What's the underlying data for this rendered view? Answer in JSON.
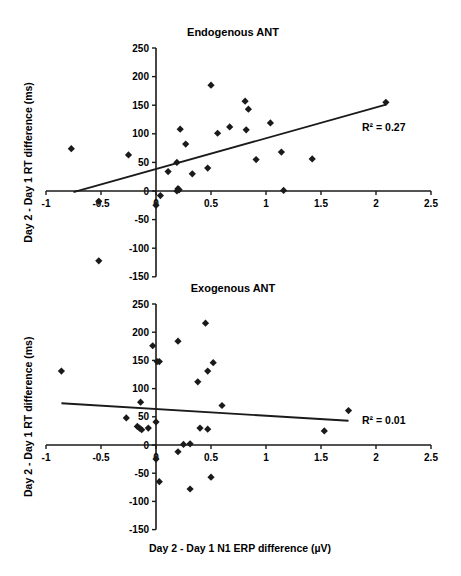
{
  "chart_data": [
    {
      "type": "scatter",
      "title": "Endogenous ANT",
      "xlabel": "",
      "ylabel": "Day 2 - Day 1 RT difference (ms)",
      "xlim": [
        -1,
        2.5
      ],
      "ylim": [
        -150,
        250
      ],
      "xticks": [
        "-1",
        "-0.5",
        "0",
        "0.5",
        "1",
        "1.5",
        "2",
        "2.5"
      ],
      "yticks": [
        "250",
        "200",
        "150",
        "100",
        "50",
        "0",
        "-50",
        "-100",
        "-150"
      ],
      "grid": false,
      "legend": null,
      "annotation": "R² = 0.27",
      "points": [
        [
          -0.77,
          74
        ],
        [
          -0.52,
          -18
        ],
        [
          -0.52,
          -122
        ],
        [
          -0.25,
          63
        ],
        [
          0.0,
          -25
        ],
        [
          0.04,
          -8
        ],
        [
          0.11,
          34
        ],
        [
          0.19,
          50
        ],
        [
          0.19,
          0
        ],
        [
          0.2,
          4
        ],
        [
          0.21,
          2
        ],
        [
          0.22,
          108
        ],
        [
          0.27,
          82
        ],
        [
          0.33,
          30
        ],
        [
          0.47,
          40
        ],
        [
          0.5,
          185
        ],
        [
          0.56,
          101
        ],
        [
          0.67,
          112
        ],
        [
          0.81,
          157
        ],
        [
          0.82,
          107
        ],
        [
          0.84,
          143
        ],
        [
          0.91,
          55
        ],
        [
          1.04,
          119
        ],
        [
          1.14,
          68
        ],
        [
          1.16,
          1
        ],
        [
          1.42,
          56
        ],
        [
          2.09,
          155
        ]
      ],
      "trendline": {
        "x": [
          -0.75,
          2.09
        ],
        "y": [
          -2,
          151
        ]
      }
    },
    {
      "type": "scatter",
      "title": "Exogenous ANT",
      "xlabel": "Day 2 - Day 1 N1 ERP difference (µV)",
      "ylabel": "Day 2 - Day 1 RT difference (ms)",
      "xlim": [
        -1,
        2.5
      ],
      "ylim": [
        -150,
        250
      ],
      "xticks": [
        "-1",
        "-0.5",
        "0",
        "0.5",
        "1",
        "1.5",
        "2",
        "2.5"
      ],
      "yticks": [
        "250",
        "200",
        "150",
        "100",
        "50",
        "0",
        "-50",
        "-100",
        "-150"
      ],
      "grid": false,
      "legend": null,
      "annotation": "R² = 0.01",
      "points": [
        [
          -0.86,
          131
        ],
        [
          -0.27,
          48
        ],
        [
          -0.17,
          33
        ],
        [
          -0.15,
          30
        ],
        [
          -0.14,
          76
        ],
        [
          -0.13,
          27
        ],
        [
          -0.07,
          30
        ],
        [
          -0.03,
          176
        ],
        [
          0.0,
          41
        ],
        [
          0.0,
          -25
        ],
        [
          0.01,
          148
        ],
        [
          0.03,
          148
        ],
        [
          0.03,
          -65
        ],
        [
          0.2,
          184
        ],
        [
          0.2,
          -12
        ],
        [
          0.25,
          1
        ],
        [
          0.31,
          2
        ],
        [
          0.31,
          -78
        ],
        [
          0.38,
          112
        ],
        [
          0.4,
          30
        ],
        [
          0.45,
          216
        ],
        [
          0.47,
          131
        ],
        [
          0.47,
          28
        ],
        [
          0.5,
          -57
        ],
        [
          0.52,
          146
        ],
        [
          0.6,
          70
        ],
        [
          1.53,
          25
        ],
        [
          1.75,
          61
        ]
      ],
      "trendline": {
        "x": [
          -0.86,
          1.75
        ],
        "y": [
          74,
          43
        ]
      }
    }
  ],
  "labels": {
    "top_title": "Endogenous ANT",
    "bottom_title": "Exogenous ANT",
    "ylabel": "Day 2 - Day 1 RT difference (ms)",
    "xlabel": "Day 2 - Day 1 N1 ERP difference (µV)",
    "top_r2": "R² = 0.27",
    "bottom_r2": "R² = 0.01"
  }
}
